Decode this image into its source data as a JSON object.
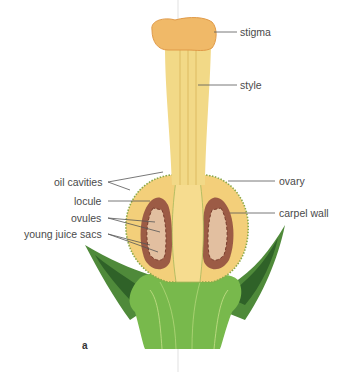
{
  "figure": {
    "panel_label": "a"
  },
  "labels": {
    "stigma": "stigma",
    "style": "style",
    "oil_cavities": "oil cavities",
    "locule": "locule",
    "ovules": "ovules",
    "young_juice_sacs": "young juice sacs",
    "ovary": "ovary",
    "carpel_wall": "carpel wall"
  },
  "colors": {
    "style_fill": "#f2d987",
    "stigma_fill": "#f0b968",
    "ovary_fill": "#f3cf7a",
    "locule_fill": "#a0604a",
    "ovule_fill": "#e8c9a8",
    "leaf_dark": "#3f7a34",
    "leaf_light": "#6aae45",
    "receptacle": "#7bbf4e",
    "leader_line": "#555555"
  }
}
